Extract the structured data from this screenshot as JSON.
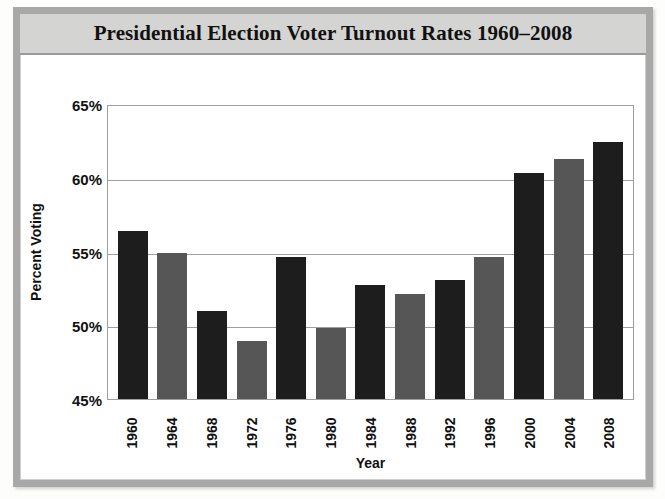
{
  "chart_data": {
    "type": "bar",
    "title": "Presidential Election Voter Turnout Rates 1960–2008",
    "xlabel": "Year",
    "ylabel": "Percent Voting",
    "categories": [
      "1960",
      "1964",
      "1968",
      "1972",
      "1976",
      "1980",
      "1984",
      "1988",
      "1992",
      "1996",
      "2000",
      "2004",
      "2008"
    ],
    "values": [
      56.4,
      54.9,
      51.0,
      48.9,
      54.6,
      49.8,
      52.7,
      52.1,
      53.1,
      54.6,
      60.3,
      61.3,
      62.4
    ],
    "ylim": [
      45,
      65
    ],
    "ytick_labels": [
      "65%",
      "60%",
      "55%",
      "50%",
      "45%"
    ],
    "ytick_values": [
      65,
      60,
      55,
      50,
      45
    ],
    "grid": true,
    "legend": "none",
    "bar_colors": [
      "#1d1d1d",
      "#565656"
    ],
    "series": [
      {
        "name": "Voter Turnout",
        "values": [
          56.4,
          54.9,
          51.0,
          48.9,
          54.6,
          49.8,
          52.7,
          52.1,
          53.1,
          54.6,
          60.3,
          61.3,
          62.4
        ]
      }
    ]
  },
  "frame": {
    "band_color": "#d4d4d2",
    "border_color": "#a8a8a8"
  }
}
